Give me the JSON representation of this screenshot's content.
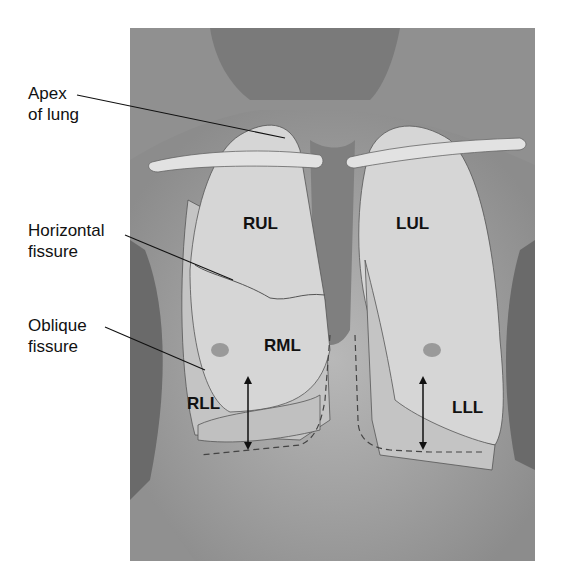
{
  "callouts": [
    {
      "id": "apex",
      "line1": "Apex",
      "line2": "of lung"
    },
    {
      "id": "horizontal",
      "line1": "Horizontal",
      "line2": "fissure"
    },
    {
      "id": "oblique",
      "line1": "Oblique",
      "line2": "fissure"
    }
  ],
  "lobes": {
    "rul": "RUL",
    "lul": "LUL",
    "rml": "RML",
    "rll": "RLL",
    "lll": "LLL"
  },
  "colors": {
    "background_skin": "#8a8a8a",
    "lung_fill": "#d6d6d6",
    "line": "#111111"
  }
}
